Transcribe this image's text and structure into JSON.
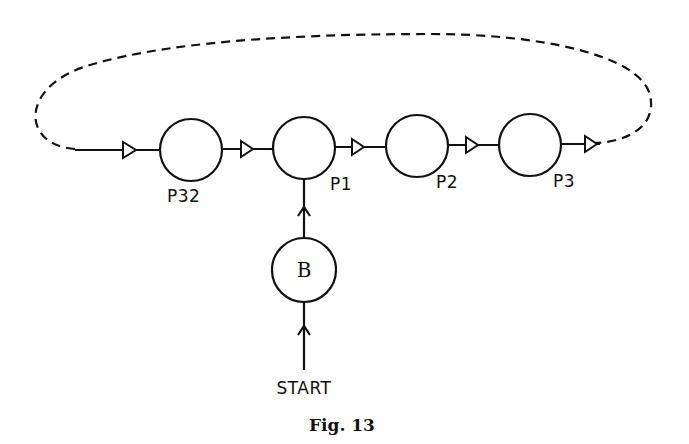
{
  "figure": {
    "caption": "Fig. 13",
    "nodes": [
      {
        "id": "P32",
        "label": "P32",
        "cx": 191,
        "cy": 150
      },
      {
        "id": "P1",
        "label": "P1",
        "cx": 304,
        "cy": 148
      },
      {
        "id": "P2",
        "label": "P2",
        "cx": 417,
        "cy": 146
      },
      {
        "id": "P3",
        "label": "P3",
        "cx": 530,
        "cy": 145
      },
      {
        "id": "B",
        "label": "B",
        "cx": 304,
        "cy": 270
      }
    ],
    "edges": [
      {
        "from": "loop",
        "to": "P32",
        "style": "solid"
      },
      {
        "from": "P32",
        "to": "P1",
        "style": "solid"
      },
      {
        "from": "P1",
        "to": "P2",
        "style": "solid"
      },
      {
        "from": "P2",
        "to": "P3",
        "style": "solid"
      },
      {
        "from": "P3",
        "to": "loop",
        "style": "solid"
      },
      {
        "from": "loop",
        "to": "loop",
        "style": "dashed",
        "note": "return path from after P3 back to before P32"
      },
      {
        "from": "B",
        "to": "P1",
        "style": "solid"
      },
      {
        "from": "START",
        "to": "B",
        "style": "solid"
      }
    ],
    "start_label": "START"
  }
}
